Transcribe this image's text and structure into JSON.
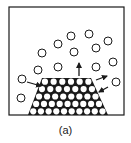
{
  "figure": {
    "caption": "(a)",
    "colors": {
      "stroke": "#1a1a1a",
      "background": "#ffffff"
    },
    "box": {
      "x": 9,
      "y": 7,
      "width": 115,
      "height": 108
    },
    "free_molecules": [
      {
        "cx": 71,
        "cy": 36
      },
      {
        "cx": 89,
        "cy": 34
      },
      {
        "cx": 108,
        "cy": 41
      },
      {
        "cx": 58,
        "cy": 44
      },
      {
        "cx": 96,
        "cy": 48
      },
      {
        "cx": 42,
        "cy": 53
      },
      {
        "cx": 74,
        "cy": 52
      },
      {
        "cx": 38,
        "cy": 70
      },
      {
        "cx": 58,
        "cy": 67
      },
      {
        "cx": 96,
        "cy": 67
      },
      {
        "cx": 113,
        "cy": 62
      },
      {
        "cx": 22,
        "cy": 79
      },
      {
        "cx": 116,
        "cy": 82
      },
      {
        "cx": 21,
        "cy": 98
      }
    ],
    "molecule_radius": 4,
    "crystal": {
      "shape": "trapezoid",
      "top_left": [
        42,
        78
      ],
      "top_right": [
        91,
        78
      ],
      "bottom_left": [
        28,
        115
      ],
      "bottom_right": [
        108,
        115
      ],
      "rows": [
        6,
        7,
        8,
        9,
        10
      ]
    },
    "arrows": [
      {
        "name": "desorb-up",
        "x1": 79,
        "y1": 76,
        "x2": 79,
        "y2": 63
      },
      {
        "name": "adsorb-left",
        "x1": 27,
        "y1": 82,
        "x2": 41,
        "y2": 86
      },
      {
        "name": "desorb-right",
        "x1": 96,
        "y1": 80,
        "x2": 107,
        "y2": 76
      },
      {
        "name": "adsorb-right",
        "x1": 108,
        "y1": 87,
        "x2": 99,
        "y2": 92
      }
    ]
  }
}
